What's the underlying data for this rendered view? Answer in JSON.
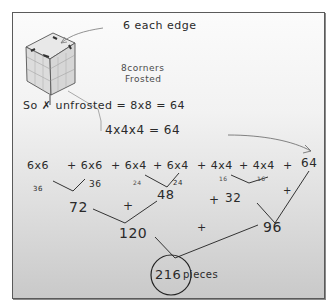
{
  "annotations": {
    "edge_label": "6 each edge",
    "corners_line1": "8corners",
    "corners_line2": "Frosted",
    "unfrosted_line1": "So ✗ unfrosted = 8x8 = 64",
    "unfrosted_line2": "4x4x4 = 64"
  },
  "sum_row": {
    "terms": [
      "6x6",
      "+ 6x6",
      "+ 6x4",
      "+ 6x4",
      "+ 4x4",
      "+ 4x4",
      "+",
      "64"
    ]
  },
  "level1": {
    "values": [
      "36",
      "36",
      "24",
      "24",
      "16",
      "16"
    ]
  },
  "level2": {
    "a": "72",
    "plus1": "+",
    "b": "48",
    "plus2": "+",
    "c": "32",
    "plus3": "+"
  },
  "level3": {
    "a": "120",
    "plus": "+",
    "b": "96"
  },
  "result": {
    "value": "216",
    "suffix": "pieces"
  }
}
